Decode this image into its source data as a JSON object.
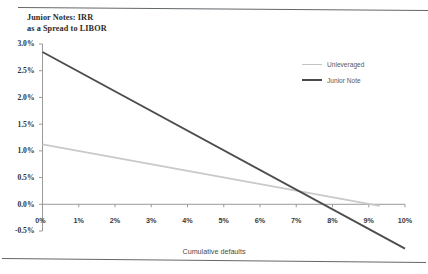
{
  "chart_data": {
    "type": "line",
    "title": "Junior Notes: IRR\nas a Spread to LIBOR",
    "title_line1": "Junior Notes: IRR",
    "title_line2": "as a Spread to LIBOR",
    "xlabel": "Cumulative defaults",
    "ylabel": "",
    "xlim": [
      0,
      10
    ],
    "ylim": [
      -0.5,
      3.0
    ],
    "xticks": [
      "0%",
      "1%",
      "2%",
      "3%",
      "4%",
      "5%",
      "6%",
      "7%",
      "8%",
      "9%",
      "10%"
    ],
    "xtick_values": [
      0,
      1,
      2,
      3,
      4,
      5,
      6,
      7,
      8,
      9,
      10
    ],
    "yticks": [
      "3.0%",
      "2.5%",
      "2.0%",
      "1.5%",
      "1.0%",
      "0.5%",
      "0.0%",
      "-0.5%"
    ],
    "ytick_values": [
      3.0,
      2.5,
      2.0,
      1.5,
      1.0,
      0.5,
      0.0,
      -0.5
    ],
    "origin_label": "0%",
    "grid": false,
    "legend_position": "upper right",
    "series": [
      {
        "name": "Unleveraged",
        "color": "#c9c9c9",
        "x": [
          0,
          9.3
        ],
        "values": [
          1.12,
          -0.03
        ]
      },
      {
        "name": "Junior Note",
        "color": "#4d4d4d",
        "x": [
          0,
          10.0
        ],
        "values": [
          2.85,
          -0.83
        ]
      }
    ],
    "annotations": {
      "junior_note_zero_crossing": "7.6%",
      "unleveraged_zero_crossing": "9.1%"
    },
    "colors": {
      "unleveraged": "#c9c9c9",
      "junior_note": "#4d4d4d",
      "axis": "#9a9a9a",
      "text": "#3a3a3a"
    }
  },
  "legend": {
    "items": [
      {
        "label": "Unleveraged"
      },
      {
        "label": "Junior Note"
      }
    ]
  }
}
